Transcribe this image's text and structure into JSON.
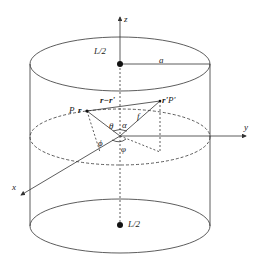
{
  "diagram": {
    "type": "cylinder-coordinate-geometry",
    "axes": {
      "z": "z",
      "y": "y",
      "x": "x"
    },
    "labels": {
      "top_center": "L/2",
      "bottom_center": "L/2",
      "radius": "a",
      "point_p_vec": "r",
      "point_p": "P",
      "point_pp_vec": "r'",
      "point_pp": "P'",
      "difference_vec": "r−r'",
      "f": "f",
      "theta": "θ",
      "alpha": "α",
      "phi_small": "ϕ",
      "phi_big": "φ"
    },
    "colors": {
      "stroke": "#333333",
      "background": "#ffffff"
    }
  }
}
